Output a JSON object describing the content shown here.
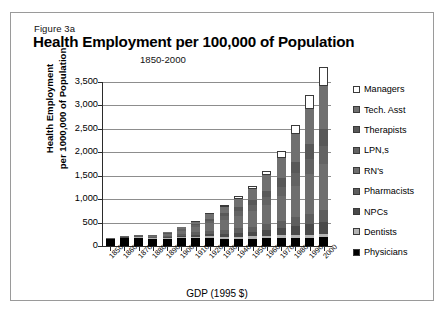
{
  "figure": {
    "figure_label": "Figure 3a",
    "title": "Health Employment per 100,000 of Population",
    "subtitle": "1850-2000"
  },
  "axes": {
    "ylabel_line1": "Health Employment",
    "ylabel_line2": "per 1000,000 of Population",
    "xlabel": "GDP (1995 $)"
  },
  "chart_data": {
    "type": "bar",
    "subtype": "stacked-bar",
    "title": "Health Employment per 100,000 of Population",
    "subtitle": "1850-2000",
    "figure_label": "Figure 3a",
    "xlabel": "GDP (1995 $)",
    "ylabel": "Health Employment per 1000,000 of Population",
    "ylim": [
      0,
      3500
    ],
    "yticks": [
      0,
      500,
      1000,
      1500,
      2000,
      2500,
      3000,
      3500
    ],
    "ytick_labels": [
      "0",
      "500",
      "1,000",
      "1,500",
      "2,000",
      "2,500",
      "3,000",
      "3,500"
    ],
    "grid": true,
    "legend_position": "right",
    "categories": [
      "1850",
      "1860",
      "1870",
      "1880",
      "1890",
      "1900",
      "1910",
      "1920",
      "1930",
      "1940",
      "1950",
      "1960",
      "1970",
      "1980",
      "1990",
      "2000"
    ],
    "series": [
      {
        "name": "Physicians",
        "color": "#000000",
        "values": [
          150,
          170,
          175,
          150,
          150,
          175,
          175,
          175,
          160,
          160,
          160,
          165,
          170,
          175,
          180,
          185
        ]
      },
      {
        "name": "Dentists",
        "color": "#b4b4b4",
        "values": [
          5,
          8,
          10,
          12,
          15,
          20,
          25,
          30,
          35,
          40,
          45,
          50,
          55,
          60,
          65,
          70
        ]
      },
      {
        "name": "NPCs",
        "color": "#4a4a4a",
        "values": [
          5,
          8,
          10,
          15,
          20,
          30,
          40,
          55,
          70,
          85,
          100,
          120,
          150,
          190,
          230,
          265
        ]
      },
      {
        "name": "Pharmacists",
        "color": "#5e5e5e",
        "values": [
          5,
          8,
          12,
          18,
          25,
          35,
          50,
          65,
          80,
          95,
          110,
          130,
          155,
          185,
          215,
          245
        ]
      },
      {
        "name": "RN's",
        "color": "#6e6e6e",
        "values": [
          5,
          10,
          15,
          25,
          40,
          70,
          110,
          160,
          215,
          270,
          330,
          420,
          530,
          680,
          840,
          980
        ]
      },
      {
        "name": "LPN,s",
        "color": "#636363",
        "values": [
          2,
          4,
          6,
          10,
          15,
          25,
          40,
          60,
          80,
          100,
          125,
          160,
          205,
          265,
          330,
          390
        ]
      },
      {
        "name": "Therapists",
        "color": "#585858",
        "values": [
          0,
          2,
          3,
          5,
          8,
          15,
          25,
          40,
          60,
          80,
          105,
          140,
          185,
          245,
          310,
          370
        ]
      },
      {
        "name": "Tech. Asst",
        "color": "#707070",
        "values": [
          3,
          5,
          8,
          12,
          20,
          35,
          60,
          95,
          140,
          185,
          240,
          325,
          440,
          590,
          760,
          905
        ]
      },
      {
        "name": "Managers",
        "color": "#ffffff",
        "values": [
          0,
          0,
          0,
          0,
          2,
          5,
          10,
          20,
          35,
          50,
          70,
          100,
          140,
          200,
          300,
          420
        ]
      }
    ],
    "totals": [
      175,
      215,
      239,
      247,
      295,
      410,
      535,
      700,
      875,
      1065,
      1285,
      1610,
      2030,
      2590,
      3230,
      3830
    ]
  },
  "legend": {
    "items": [
      {
        "label": "Managers",
        "color": "#ffffff"
      },
      {
        "label": "Tech. Asst",
        "color": "#707070"
      },
      {
        "label": "Therapists",
        "color": "#585858"
      },
      {
        "label": "LPN,s",
        "color": "#636363"
      },
      {
        "label": "RN's",
        "color": "#6e6e6e"
      },
      {
        "label": "Pharmacists",
        "color": "#5e5e5e"
      },
      {
        "label": "NPCs",
        "color": "#4a4a4a"
      },
      {
        "label": "Dentists",
        "color": "#b4b4b4"
      },
      {
        "label": "Physicians",
        "color": "#000000"
      }
    ]
  }
}
